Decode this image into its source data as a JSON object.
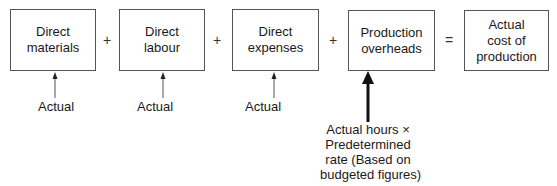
{
  "boxes": [
    {
      "id": "direct-materials",
      "line1": "Direct",
      "line2": "materials"
    },
    {
      "id": "direct-labour",
      "line1": "Direct",
      "line2": "labour"
    },
    {
      "id": "direct-expenses",
      "line1": "Direct",
      "line2": "expenses"
    },
    {
      "id": "production-overheads",
      "line1": "Production",
      "line2": "overheads"
    },
    {
      "id": "actual-cost",
      "line1": "Actual",
      "line2": "cost of",
      "line3": "production"
    }
  ],
  "operators": [
    "+",
    "+",
    "+",
    "="
  ],
  "annotations": {
    "materials": "Actual",
    "labour": "Actual",
    "expenses": "Actual",
    "overheads": [
      "Actual hours ×",
      "Predetermined",
      "rate (Based on",
      "budgeted figures)"
    ]
  }
}
